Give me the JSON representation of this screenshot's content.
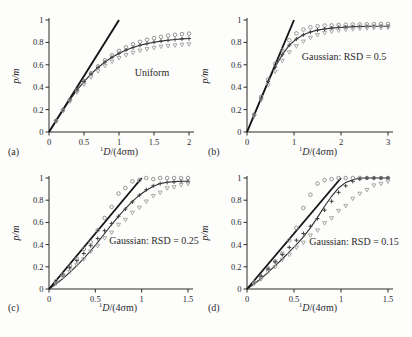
{
  "figure": {
    "background": "#fdfdfc",
    "text_color": "#2a2a2a",
    "axis_color": "#2a2a2a"
  },
  "chart_data": [
    {
      "type": "scatter",
      "panel_label": "(a)",
      "annotation": "Uniform",
      "xlabel_sup": "1",
      "xlabel_var": "D",
      "xlabel_rest": "/(4σm)",
      "ylabel": "p/m",
      "xlim": [
        0,
        2
      ],
      "ylim": [
        0,
        1
      ],
      "xticks": [
        0,
        0.5,
        1,
        1.5,
        2
      ],
      "xtick_labels": [
        "0",
        "0.5",
        "1",
        "1.5",
        "2"
      ],
      "yticks": [
        0,
        0.2,
        0.4,
        0.6,
        0.8,
        1
      ],
      "ytick_labels": [
        "0",
        "0.2",
        "0.4",
        "0.6",
        "0.8",
        "1"
      ],
      "grid": false,
      "legend": "none",
      "reference_line": {
        "from": [
          0,
          0
        ],
        "to": [
          1,
          1
        ],
        "color": "#161616"
      },
      "x": [
        0,
        0.1,
        0.2,
        0.3,
        0.4,
        0.5,
        0.6,
        0.7,
        0.8,
        0.9,
        1.0,
        1.1,
        1.2,
        1.3,
        1.4,
        1.5,
        1.6,
        1.7,
        1.8,
        1.9,
        2.0
      ],
      "series": [
        {
          "name": "upper-circles",
          "marker": "circle",
          "color": "#8a8a8a",
          "values": [
            0,
            0.1,
            0.197,
            0.289,
            0.375,
            0.455,
            0.525,
            0.586,
            0.64,
            0.685,
            0.724,
            0.756,
            0.783,
            0.805,
            0.823,
            0.838,
            0.85,
            0.86,
            0.868,
            0.874,
            0.879
          ]
        },
        {
          "name": "middle-plus",
          "marker": "plus",
          "color": "#424242",
          "values": [
            0,
            0.099,
            0.196,
            0.288,
            0.373,
            0.449,
            0.517,
            0.576,
            0.625,
            0.667,
            0.702,
            0.731,
            0.754,
            0.774,
            0.789,
            0.802,
            0.812,
            0.819,
            0.826,
            0.831,
            0.835
          ]
        },
        {
          "name": "lower-triangles",
          "marker": "triangle-down",
          "color": "#9f9f9f",
          "values": [
            0,
            0.095,
            0.188,
            0.275,
            0.355,
            0.427,
            0.49,
            0.545,
            0.592,
            0.63,
            0.662,
            0.688,
            0.71,
            0.728,
            0.742,
            0.754,
            0.763,
            0.77,
            0.776,
            0.781,
            0.785
          ]
        }
      ],
      "model_curve": {
        "color": "#2d2d2d",
        "values": [
          0,
          0.099,
          0.196,
          0.288,
          0.373,
          0.449,
          0.517,
          0.576,
          0.625,
          0.667,
          0.702,
          0.731,
          0.754,
          0.774,
          0.789,
          0.802,
          0.812,
          0.819,
          0.826,
          0.831,
          0.835
        ]
      }
    },
    {
      "type": "scatter",
      "panel_label": "(b)",
      "annotation": "Gaussian: RSD = 0.5",
      "xlabel_sup": "1",
      "xlabel_var": "D",
      "xlabel_rest": "/(4σm)",
      "ylabel": "p/m",
      "xlim": [
        0,
        3
      ],
      "ylim": [
        0,
        1
      ],
      "xticks": [
        0,
        1,
        2,
        3
      ],
      "xtick_labels": [
        "0",
        "1",
        "2",
        "3"
      ],
      "yticks": [
        0,
        0.2,
        0.4,
        0.6,
        0.8,
        1
      ],
      "ytick_labels": [
        "0",
        "0.2",
        "0.4",
        "0.6",
        "0.8",
        "1"
      ],
      "grid": false,
      "legend": "none",
      "reference_line": {
        "from": [
          0,
          0
        ],
        "to": [
          1,
          1
        ],
        "color": "#161616"
      },
      "x": [
        0,
        0.15,
        0.3,
        0.45,
        0.6,
        0.75,
        0.9,
        1.05,
        1.2,
        1.35,
        1.5,
        1.65,
        1.8,
        1.95,
        2.1,
        2.25,
        2.4,
        2.55,
        2.7,
        2.85,
        3.0
      ],
      "series": [
        {
          "name": "upper-circles",
          "marker": "circle",
          "color": "#8a8a8a",
          "values": [
            0,
            0.155,
            0.315,
            0.47,
            0.61,
            0.73,
            0.82,
            0.88,
            0.915,
            0.935,
            0.945,
            0.95,
            0.952,
            0.955,
            0.957,
            0.96,
            0.96,
            0.962,
            0.963,
            0.964,
            0.965
          ]
        },
        {
          "name": "middle-plus",
          "marker": "plus",
          "color": "#424242",
          "values": [
            0,
            0.15,
            0.3,
            0.45,
            0.58,
            0.69,
            0.775,
            0.83,
            0.868,
            0.893,
            0.91,
            0.92,
            0.928,
            0.933,
            0.937,
            0.94,
            0.942,
            0.943,
            0.944,
            0.945,
            0.945
          ]
        },
        {
          "name": "lower-triangles",
          "marker": "triangle-down",
          "color": "#9f9f9f",
          "values": [
            0,
            0.142,
            0.285,
            0.42,
            0.54,
            0.638,
            0.713,
            0.768,
            0.81,
            0.843,
            0.868,
            0.886,
            0.899,
            0.908,
            0.915,
            0.92,
            0.924,
            0.928,
            0.93,
            0.932,
            0.934
          ]
        }
      ],
      "model_curve": {
        "color": "#2d2d2d",
        "values": [
          0,
          0.15,
          0.3,
          0.45,
          0.58,
          0.69,
          0.775,
          0.83,
          0.868,
          0.893,
          0.91,
          0.92,
          0.928,
          0.933,
          0.937,
          0.94,
          0.942,
          0.943,
          0.944,
          0.945,
          0.945
        ]
      }
    },
    {
      "type": "scatter",
      "panel_label": "(c)",
      "annotation": "Gaussian: RSD = 0.25",
      "xlabel_sup": "1",
      "xlabel_var": "D",
      "xlabel_rest": "/(4σm)",
      "ylabel": "p/m",
      "xlim": [
        0,
        1.5
      ],
      "ylim": [
        0,
        1
      ],
      "xticks": [
        0,
        0.5,
        1,
        1.5
      ],
      "xtick_labels": [
        "0",
        "0.5",
        "1",
        "1.5"
      ],
      "yticks": [
        0,
        0.2,
        0.4,
        0.6,
        0.8,
        1
      ],
      "ytick_labels": [
        "0",
        "0.2",
        "0.4",
        "0.6",
        "0.8",
        "1"
      ],
      "grid": false,
      "legend": "none",
      "reference_line": {
        "from": [
          0,
          0
        ],
        "to": [
          1,
          1
        ],
        "color": "#161616"
      },
      "x": [
        0,
        0.075,
        0.15,
        0.225,
        0.3,
        0.375,
        0.45,
        0.525,
        0.6,
        0.675,
        0.75,
        0.825,
        0.9,
        0.975,
        1.05,
        1.125,
        1.2,
        1.275,
        1.35,
        1.425,
        1.5
      ],
      "series": [
        {
          "name": "upper-circles",
          "marker": "circle",
          "color": "#8a8a8a",
          "values": [
            0,
            0.07,
            0.13,
            0.21,
            0.27,
            0.36,
            0.42,
            0.53,
            0.64,
            0.74,
            0.86,
            0.91,
            0.97,
            0.98,
            1.0,
            0.99,
            1.0,
            1.0,
            1.0,
            1.0,
            1.0
          ]
        },
        {
          "name": "middle-plus",
          "marker": "plus",
          "color": "#424242",
          "values": [
            0,
            0.06,
            0.125,
            0.19,
            0.255,
            0.32,
            0.39,
            0.455,
            0.525,
            0.59,
            0.655,
            0.72,
            0.785,
            0.845,
            0.895,
            0.93,
            0.95,
            0.96,
            0.965,
            0.968,
            0.97
          ]
        },
        {
          "name": "lower-triangles",
          "marker": "triangle-down",
          "color": "#9f9f9f",
          "values": [
            0,
            0.05,
            0.11,
            0.155,
            0.22,
            0.27,
            0.34,
            0.39,
            0.46,
            0.51,
            0.58,
            0.625,
            0.69,
            0.735,
            0.79,
            0.84,
            0.87,
            0.91,
            0.92,
            0.94,
            0.95
          ]
        }
      ],
      "model_curve": {
        "color": "#2d2d2d",
        "values": [
          0,
          0.045,
          0.095,
          0.15,
          0.21,
          0.275,
          0.345,
          0.42,
          0.5,
          0.58,
          0.655,
          0.725,
          0.79,
          0.845,
          0.89,
          0.925,
          0.95,
          0.962,
          0.968,
          0.97,
          0.97
        ]
      }
    },
    {
      "type": "scatter",
      "panel_label": "(d)",
      "annotation": "Gaussian: RSD = 0.15",
      "xlabel_sup": "1",
      "xlabel_var": "D",
      "xlabel_rest": "/(4σm)",
      "ylabel": "p/m",
      "xlim": [
        0,
        1.5
      ],
      "ylim": [
        0,
        1
      ],
      "xticks": [
        0,
        0.5,
        1,
        1.5
      ],
      "xtick_labels": [
        "0",
        "0.5",
        "1",
        "1.5"
      ],
      "yticks": [
        0,
        0.2,
        0.4,
        0.6,
        0.8,
        1
      ],
      "ytick_labels": [
        "0",
        "0.2",
        "0.4",
        "0.6",
        "0.8",
        "1"
      ],
      "grid": false,
      "legend": "none",
      "reference_line": {
        "from": [
          0,
          0
        ],
        "to": [
          1,
          1
        ],
        "color": "#161616"
      },
      "x": [
        0,
        0.075,
        0.15,
        0.225,
        0.3,
        0.375,
        0.45,
        0.525,
        0.6,
        0.675,
        0.75,
        0.825,
        0.9,
        0.975,
        1.05,
        1.125,
        1.2,
        1.275,
        1.35,
        1.425,
        1.5
      ],
      "series": [
        {
          "name": "upper-circles",
          "marker": "circle",
          "color": "#8a8a8a",
          "values": [
            0,
            0.06,
            0.11,
            0.185,
            0.25,
            0.32,
            0.44,
            0.55,
            0.73,
            0.85,
            0.95,
            0.98,
            0.99,
            1.0,
            1.0,
            1.0,
            1.0,
            1.0,
            1.0,
            1.0,
            1.0
          ]
        },
        {
          "name": "middle-plus",
          "marker": "plus",
          "color": "#424242",
          "values": [
            0,
            0.055,
            0.115,
            0.18,
            0.245,
            0.31,
            0.375,
            0.44,
            0.5,
            0.565,
            0.635,
            0.71,
            0.79,
            0.87,
            0.93,
            0.97,
            0.99,
            1.0,
            1.0,
            1.0,
            1.0
          ]
        },
        {
          "name": "lower-triangles",
          "marker": "triangle-down",
          "color": "#9f9f9f",
          "values": [
            0,
            0.05,
            0.09,
            0.155,
            0.2,
            0.265,
            0.31,
            0.375,
            0.42,
            0.485,
            0.53,
            0.595,
            0.64,
            0.705,
            0.75,
            0.815,
            0.86,
            0.895,
            0.935,
            0.95,
            0.97
          ]
        }
      ],
      "model_curve": {
        "color": "#2d2d2d",
        "values": [
          0,
          0.045,
          0.095,
          0.15,
          0.21,
          0.27,
          0.335,
          0.4,
          0.47,
          0.55,
          0.645,
          0.745,
          0.835,
          0.91,
          0.96,
          0.985,
          1.0,
          1.0,
          1.0,
          1.0,
          1.0
        ]
      }
    }
  ]
}
